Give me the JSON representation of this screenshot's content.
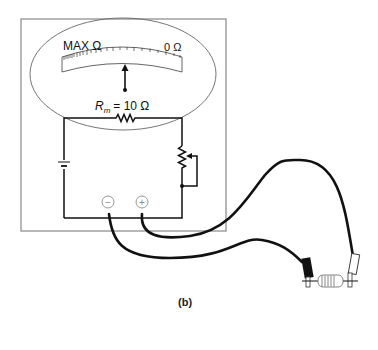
{
  "figure": {
    "caption": "(b)",
    "meter": {
      "scale_left_label": "MAX Ω",
      "scale_right_label": "0 Ω",
      "resistance_label_symbol": "R",
      "resistance_label_subscript": "m",
      "resistance_label_value": "= 10 Ω"
    },
    "terminals": {
      "negative": "−",
      "positive": "+"
    },
    "components": [
      "meter-face",
      "pointer",
      "internal-resistor",
      "battery",
      "variable-resistor",
      "test-leads",
      "resistor-under-test"
    ],
    "colors": {
      "line": "#111111",
      "box": "#888888",
      "terminal": "#999999"
    }
  }
}
